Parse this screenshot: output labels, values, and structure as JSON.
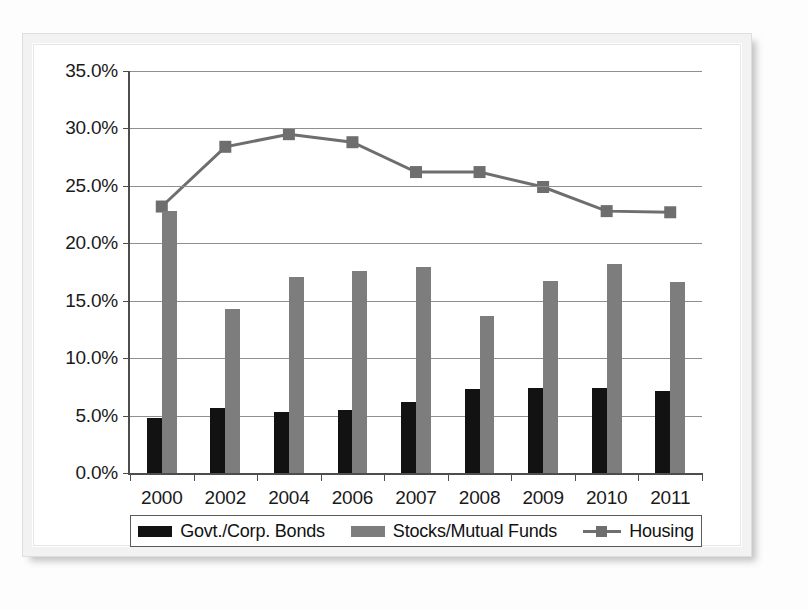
{
  "figure": {
    "legend_items": [
      {
        "label": "Govt./Corp. Bonds",
        "marker": "black-square-swatch",
        "color": "#121212"
      },
      {
        "label": "Stocks/Mutual Funds",
        "marker": "gray-square-swatch",
        "color": "#7d7d7d"
      },
      {
        "label": "Housing",
        "marker": "line-with-square-marker",
        "color": "#6e6e6e"
      }
    ]
  },
  "chart_data": {
    "type": "bar",
    "title": "",
    "xlabel": "",
    "ylabel": "",
    "ylim": [
      0,
      35
    ],
    "ytick_labels": [
      "0.0%",
      "5.0%",
      "10.0%",
      "15.0%",
      "20.0%",
      "25.0%",
      "30.0%",
      "35.0%"
    ],
    "ytick_values": [
      0,
      5,
      10,
      15,
      20,
      25,
      30,
      35
    ],
    "grid": true,
    "legend_position": "bottom",
    "categories": [
      "2000",
      "2002",
      "2004",
      "2006",
      "2007",
      "2008",
      "2009",
      "2010",
      "2011"
    ],
    "series": [
      {
        "name": "Govt./Corp. Bonds",
        "type": "bar",
        "color": "#121212",
        "values": [
          4.8,
          5.7,
          5.3,
          5.5,
          6.2,
          7.3,
          7.4,
          7.4,
          7.1
        ]
      },
      {
        "name": "Stocks/Mutual Funds",
        "type": "bar",
        "color": "#7d7d7d",
        "values": [
          22.8,
          14.3,
          17.1,
          17.6,
          17.9,
          13.7,
          16.7,
          18.2,
          16.6
        ]
      },
      {
        "name": "Housing",
        "type": "line",
        "color": "#6e6e6e",
        "values": [
          23.2,
          28.4,
          29.5,
          28.8,
          26.2,
          26.2,
          24.9,
          22.8,
          22.7
        ]
      }
    ]
  }
}
